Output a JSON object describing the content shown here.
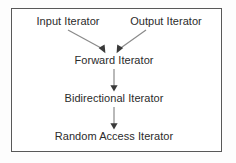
{
  "diagram": {
    "type": "hierarchy-flow",
    "background_color": "#ffffff",
    "border_color": "#595959",
    "text_color": "#2b2b2b",
    "arrow_color": "#808080",
    "nodes": [
      {
        "id": "input-iterator",
        "label": "Input Iterator",
        "level": 1,
        "cx": 68,
        "cy": 22
      },
      {
        "id": "output-iterator",
        "label": "Output Iterator",
        "level": 1,
        "cx": 166,
        "cy": 22
      },
      {
        "id": "forward-iterator",
        "label": "Forward Iterator",
        "level": 2,
        "cx": 114,
        "cy": 61
      },
      {
        "id": "bidirectional-iterator",
        "label": "Bidirectional Iterator",
        "level": 3,
        "cx": 114,
        "cy": 99
      },
      {
        "id": "random-access-iterator",
        "label": "Random Access Iterator",
        "level": 4,
        "cx": 114,
        "cy": 137
      }
    ],
    "edges": [
      {
        "id": "edge-input-to-forward",
        "from": "input-iterator",
        "to": "forward-iterator",
        "style": "diagonal-down-right"
      },
      {
        "id": "edge-output-to-forward",
        "from": "output-iterator",
        "to": "forward-iterator",
        "style": "diagonal-down-left"
      },
      {
        "id": "edge-forward-to-bidirectional",
        "from": "forward-iterator",
        "to": "bidirectional-iterator",
        "style": "vertical-down"
      },
      {
        "id": "edge-bidirectional-to-random",
        "from": "bidirectional-iterator",
        "to": "random-access-iterator",
        "style": "vertical-down"
      }
    ]
  }
}
